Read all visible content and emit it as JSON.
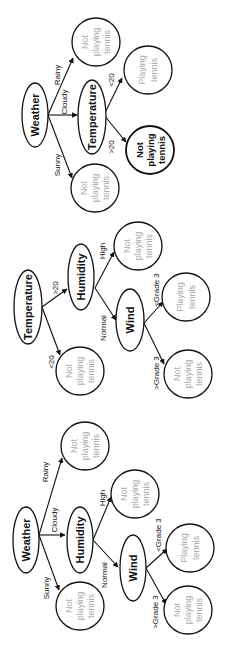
{
  "trees": [
    {
      "root": "Weather",
      "edges": {
        "rainy": "Rainy",
        "cloudy": "Cloudy",
        "sunny": "Sunny",
        "lt20": "<20",
        "gt20": ">20"
      },
      "nodes": {
        "temperature": "Temperature"
      },
      "leaves": {
        "rainy": [
          "Not",
          "playing",
          "tennis"
        ],
        "lt20": [
          "Playing",
          "tennis"
        ],
        "gt20": [
          "Not",
          "playing",
          "tennis"
        ],
        "sunny": [
          "Not",
          "playing",
          "tennis"
        ]
      }
    },
    {
      "root": "Temperature",
      "edges": {
        "gt20": ">20",
        "lt20": "<20",
        "high": "High",
        "normal": "Normal",
        "lt_grade3": "<Grade  3",
        "gt_grade3": ">Grade  3"
      },
      "nodes": {
        "humidity": "Humidity",
        "wind": "Wind"
      },
      "leaves": {
        "lt20": [
          "Not",
          "playing",
          "tennis"
        ],
        "high": [
          "Not",
          "playing",
          "tennis"
        ],
        "lt_grade3": [
          "Playing",
          "tennis"
        ],
        "gt_grade3": [
          "Not",
          "playing",
          "tennis"
        ]
      }
    },
    {
      "root": "Weather",
      "edges": {
        "rainy": "Rainy",
        "cloudy": "Cloudy",
        "sunny": "Sunny",
        "high": "High",
        "normal": "Normal",
        "lt_grade3": "<Grade  3",
        "gt_grade3": ">Grade  3"
      },
      "nodes": {
        "humidity": "Humidity",
        "wind": "Wind"
      },
      "leaves": {
        "rainy": [
          "Not",
          "playing",
          "tennis"
        ],
        "high": [
          "Not",
          "playing",
          "tennis"
        ],
        "lt_grade3": [
          "Playing",
          "tennis"
        ],
        "gt_grade3": [
          "Not",
          "playing",
          "tennis"
        ],
        "sunny": [
          "Not",
          "playing",
          "tennis"
        ]
      }
    }
  ]
}
